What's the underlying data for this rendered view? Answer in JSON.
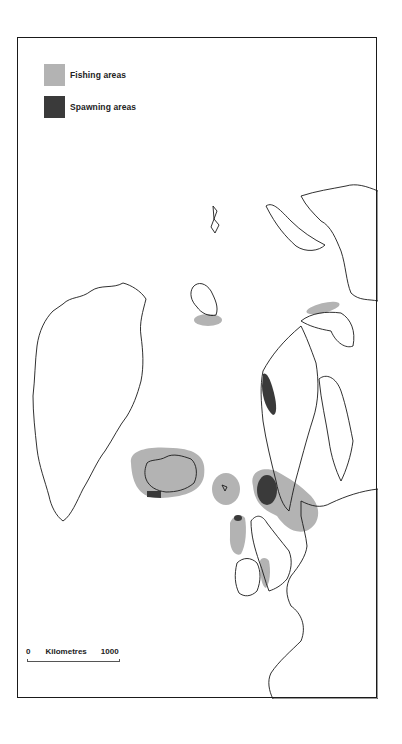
{
  "legend": {
    "items": [
      {
        "label": "Fishing areas",
        "color": "#b3b3b3"
      },
      {
        "label": "Spawning areas",
        "color": "#3a3a3a"
      }
    ]
  },
  "scale_bar": {
    "start": "0",
    "unit": "Kilometres",
    "end": "1000"
  },
  "colors": {
    "fishing": "#b3b3b3",
    "spawning": "#3a3a3a",
    "coastline": "#1a1a1a",
    "frame": "#1a1a1a"
  }
}
